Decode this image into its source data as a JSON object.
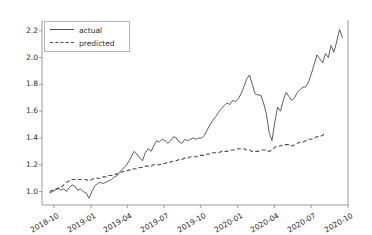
{
  "chart_data": {
    "type": "line",
    "title": "",
    "xlabel": "",
    "ylabel": "",
    "grid": false,
    "legend_position": "upper left",
    "xlim": [
      "2018-09-01",
      "2020-10-01"
    ],
    "ylim": [
      0.9,
      2.28
    ],
    "yticks": [
      "1.0",
      "1.2",
      "1.4",
      "1.6",
      "1.8",
      "2.0",
      "2.2"
    ],
    "ytick_values": [
      1.0,
      1.2,
      1.4,
      1.6,
      1.8,
      2.0,
      2.2
    ],
    "xticks": [
      "2018-10",
      "2019-01",
      "2019-04",
      "2019-07",
      "2019-10",
      "2020-01",
      "2020-04",
      "2020-07",
      "2020-10"
    ],
    "series": [
      {
        "name": "actual",
        "style": "solid",
        "color": "#4d4d4d",
        "x": [
          "2018-09-20",
          "2018-09-27",
          "2018-10-04",
          "2018-10-11",
          "2018-10-18",
          "2018-10-25",
          "2018-11-01",
          "2018-11-08",
          "2018-11-15",
          "2018-11-22",
          "2018-11-29",
          "2018-12-06",
          "2018-12-13",
          "2018-12-20",
          "2018-12-27",
          "2019-01-03",
          "2019-01-10",
          "2019-01-17",
          "2019-01-24",
          "2019-01-31",
          "2019-02-07",
          "2019-02-14",
          "2019-02-21",
          "2019-02-28",
          "2019-03-07",
          "2019-03-14",
          "2019-03-21",
          "2019-03-28",
          "2019-04-04",
          "2019-04-11",
          "2019-04-18",
          "2019-04-25",
          "2019-05-02",
          "2019-05-09",
          "2019-05-16",
          "2019-05-23",
          "2019-05-30",
          "2019-06-06",
          "2019-06-13",
          "2019-06-20",
          "2019-06-27",
          "2019-07-04",
          "2019-07-11",
          "2019-07-18",
          "2019-07-25",
          "2019-08-01",
          "2019-08-08",
          "2019-08-15",
          "2019-08-22",
          "2019-08-29",
          "2019-09-05",
          "2019-09-12",
          "2019-09-19",
          "2019-09-26",
          "2019-10-03",
          "2019-10-10",
          "2019-10-17",
          "2019-10-24",
          "2019-10-31",
          "2019-11-07",
          "2019-11-14",
          "2019-11-21",
          "2019-11-28",
          "2019-12-05",
          "2019-12-12",
          "2019-12-19",
          "2019-12-26",
          "2020-01-02",
          "2020-01-09",
          "2020-01-16",
          "2020-01-23",
          "2020-01-30",
          "2020-02-06",
          "2020-02-13",
          "2020-02-20",
          "2020-02-27",
          "2020-03-05",
          "2020-03-12",
          "2020-03-19",
          "2020-03-26",
          "2020-04-02",
          "2020-04-09",
          "2020-04-16",
          "2020-04-23",
          "2020-04-30",
          "2020-05-07",
          "2020-05-14",
          "2020-05-21",
          "2020-05-28",
          "2020-06-04",
          "2020-06-11",
          "2020-06-18",
          "2020-06-25",
          "2020-07-02",
          "2020-07-09",
          "2020-07-16",
          "2020-07-23",
          "2020-07-30",
          "2020-08-06",
          "2020-08-13",
          "2020-08-20",
          "2020-08-27"
        ],
        "y": [
          0.99,
          1.0,
          1.01,
          1.03,
          1.01,
          1.02,
          1.0,
          1.03,
          1.05,
          1.04,
          1.01,
          1.02,
          1.0,
          0.99,
          0.95,
          1.0,
          1.04,
          1.06,
          1.07,
          1.06,
          1.07,
          1.08,
          1.09,
          1.11,
          1.12,
          1.15,
          1.17,
          1.19,
          1.22,
          1.26,
          1.3,
          1.28,
          1.25,
          1.23,
          1.29,
          1.32,
          1.3,
          1.34,
          1.38,
          1.37,
          1.39,
          1.38,
          1.36,
          1.38,
          1.41,
          1.4,
          1.37,
          1.36,
          1.39,
          1.38,
          1.39,
          1.4,
          1.39,
          1.4,
          1.4,
          1.42,
          1.46,
          1.5,
          1.53,
          1.56,
          1.59,
          1.62,
          1.64,
          1.66,
          1.65,
          1.68,
          1.67,
          1.69,
          1.73,
          1.78,
          1.84,
          1.87,
          1.8,
          1.73,
          1.72,
          1.72,
          1.66,
          1.58,
          1.44,
          1.38,
          1.52,
          1.63,
          1.6,
          1.68,
          1.74,
          1.71,
          1.68,
          1.7,
          1.74,
          1.76,
          1.78,
          1.78,
          1.82,
          1.88,
          1.95,
          2.02,
          1.99,
          1.96,
          2.03,
          2.0,
          2.09,
          2.04
        ],
        "last_values_tail": [
          2.12,
          2.21,
          2.15
        ]
      },
      {
        "name": "predicted",
        "style": "dashed",
        "color": "#4d4d4d",
        "x": [
          "2018-09-20",
          "2018-09-27",
          "2018-10-04",
          "2018-10-11",
          "2018-10-18",
          "2018-10-25",
          "2018-11-01",
          "2018-11-08",
          "2018-11-15",
          "2018-11-22",
          "2018-11-29",
          "2018-12-06",
          "2018-12-13",
          "2018-12-20",
          "2018-12-27",
          "2019-01-03",
          "2019-01-10",
          "2019-01-17",
          "2019-01-24",
          "2019-01-31",
          "2019-02-07",
          "2019-02-14",
          "2019-02-21",
          "2019-02-28",
          "2019-03-07",
          "2019-03-14",
          "2019-03-21",
          "2019-03-28",
          "2019-04-04",
          "2019-04-11",
          "2019-04-18",
          "2019-04-25",
          "2019-05-02",
          "2019-05-09",
          "2019-05-16",
          "2019-05-23",
          "2019-05-30",
          "2019-06-06",
          "2019-06-13",
          "2019-06-20",
          "2019-06-27",
          "2019-07-04",
          "2019-07-11",
          "2019-07-18",
          "2019-07-25",
          "2019-08-01",
          "2019-08-08",
          "2019-08-15",
          "2019-08-22",
          "2019-08-29",
          "2019-09-05",
          "2019-09-12",
          "2019-09-19",
          "2019-09-26",
          "2019-10-03",
          "2019-10-10",
          "2019-10-17",
          "2019-10-24",
          "2019-10-31",
          "2019-11-07",
          "2019-11-14",
          "2019-11-21",
          "2019-11-28",
          "2019-12-05",
          "2019-12-12",
          "2019-12-19",
          "2019-12-26",
          "2020-01-02",
          "2020-01-09",
          "2020-01-16",
          "2020-01-23",
          "2020-01-30",
          "2020-02-06",
          "2020-02-13",
          "2020-02-20",
          "2020-02-27",
          "2020-03-05",
          "2020-03-12",
          "2020-03-19",
          "2020-03-26",
          "2020-04-02",
          "2020-04-09",
          "2020-04-16",
          "2020-04-23",
          "2020-04-30",
          "2020-05-07",
          "2020-05-14",
          "2020-05-21",
          "2020-05-28",
          "2020-06-04",
          "2020-06-11",
          "2020-06-18",
          "2020-06-25",
          "2020-07-02",
          "2020-07-09",
          "2020-07-16",
          "2020-07-23",
          "2020-07-30",
          "2020-08-06"
        ],
        "y": [
          1.0,
          1.01,
          1.02,
          1.02,
          1.03,
          1.05,
          1.07,
          1.08,
          1.09,
          1.09,
          1.09,
          1.09,
          1.09,
          1.09,
          1.08,
          1.09,
          1.1,
          1.1,
          1.1,
          1.11,
          1.11,
          1.12,
          1.12,
          1.13,
          1.13,
          1.14,
          1.15,
          1.15,
          1.16,
          1.16,
          1.17,
          1.17,
          1.18,
          1.18,
          1.19,
          1.19,
          1.19,
          1.2,
          1.2,
          1.2,
          1.21,
          1.21,
          1.22,
          1.22,
          1.23,
          1.23,
          1.24,
          1.24,
          1.25,
          1.25,
          1.26,
          1.26,
          1.26,
          1.27,
          1.27,
          1.27,
          1.28,
          1.28,
          1.29,
          1.29,
          1.29,
          1.3,
          1.3,
          1.3,
          1.31,
          1.31,
          1.31,
          1.32,
          1.32,
          1.32,
          1.31,
          1.31,
          1.3,
          1.3,
          1.3,
          1.31,
          1.31,
          1.31,
          1.3,
          1.31,
          1.33,
          1.34,
          1.34,
          1.35,
          1.35,
          1.35,
          1.34,
          1.35,
          1.36,
          1.37,
          1.37,
          1.38,
          1.39,
          1.39,
          1.4,
          1.41,
          1.41,
          1.42,
          1.44
        ]
      }
    ]
  },
  "legend": {
    "entries": [
      {
        "label": "actual"
      },
      {
        "label": "predicted"
      }
    ]
  },
  "axes": {
    "y_tick_labels": [
      "2.2",
      "2.0",
      "1.8",
      "1.6",
      "1.4",
      "1.2",
      "1.0"
    ],
    "x_tick_labels": [
      "2018-10",
      "2019-01",
      "2019-04",
      "2019-07",
      "2019-10",
      "2020-01",
      "2020-04",
      "2020-07",
      "2020-10"
    ]
  },
  "colors": {
    "line": "#4d4d4d",
    "axis": "#9a9a9a",
    "text": "#2b2b2b",
    "background": "#ffffff"
  }
}
